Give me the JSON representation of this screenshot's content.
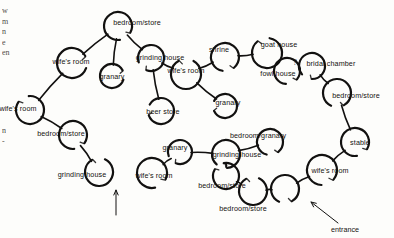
{
  "figure": {
    "kind": "homestead-plan-diagram",
    "ink_color": "#121110",
    "paper_color": "#fdfdfb",
    "width": 394,
    "height": 238
  },
  "margin_text": {
    "upper_left": "w\nm\nn\ne\nen",
    "lower_left": "n\n-"
  },
  "huts": [
    {
      "id": "h1",
      "label": "bedroom/store",
      "cx": 118,
      "cy": 26,
      "r": 14,
      "gap_start": 118,
      "gap_end": 172,
      "label_x": 137,
      "label_y": 23
    },
    {
      "id": "h2",
      "label": "wife's room",
      "cx": 72,
      "cy": 63,
      "r": 15,
      "gap_start": 62,
      "gap_end": 110,
      "label_x": 71,
      "label_y": 62
    },
    {
      "id": "h3",
      "label": "granary",
      "cx": 112,
      "cy": 76,
      "r": 12,
      "gap_start": 62,
      "gap_end": 108,
      "label_x": 112,
      "label_y": 77
    },
    {
      "id": "h4",
      "label": "grinding house",
      "cx": 151,
      "cy": 58,
      "r": 13,
      "gap_start": 200,
      "gap_end": 250,
      "label_x": 160,
      "label_y": 58
    },
    {
      "id": "h5",
      "label": "wife's room",
      "cx": 186,
      "cy": 74,
      "r": 15,
      "gap_start": 330,
      "gap_end": 30,
      "label_x": 186,
      "label_y": 71
    },
    {
      "id": "h6",
      "label": "beer store",
      "cx": 161,
      "cy": 111,
      "r": 13,
      "gap_start": 250,
      "gap_end": 300,
      "label_x": 163,
      "label_y": 112
    },
    {
      "id": "h7",
      "label": "granary",
      "cx": 225,
      "cy": 106,
      "r": 12,
      "gap_start": 245,
      "gap_end": 295,
      "label_x": 228,
      "label_y": 103
    },
    {
      "id": "h8",
      "label": "shrine",
      "cx": 225,
      "cy": 57,
      "r": 14,
      "gap_start": 140,
      "gap_end": 190,
      "label_x": 219,
      "label_y": 50
    },
    {
      "id": "h9",
      "label": "goat house",
      "cx": 267,
      "cy": 53,
      "r": 15,
      "gap_start": 320,
      "gap_end": 10,
      "label_x": 279,
      "label_y": 45
    },
    {
      "id": "h10",
      "label": "fowl house",
      "cx": 287,
      "cy": 71,
      "r": 13,
      "gap_start": 130,
      "gap_end": 185,
      "label_x": 278,
      "label_y": 74
    },
    {
      "id": "h11",
      "label": "bridal chamber",
      "cx": 312,
      "cy": 66,
      "r": 13,
      "gap_start": 180,
      "gap_end": 230,
      "label_x": 331,
      "label_y": 64
    },
    {
      "id": "h12",
      "label": "bedroom/store",
      "cx": 337,
      "cy": 93,
      "r": 14,
      "gap_start": 150,
      "gap_end": 205,
      "label_x": 356,
      "label_y": 96
    },
    {
      "id": "h13",
      "label": "stable",
      "cx": 355,
      "cy": 142,
      "r": 14,
      "gap_start": 120,
      "gap_end": 172,
      "label_x": 360,
      "label_y": 143
    },
    {
      "id": "h14",
      "label": "wife's room",
      "cx": 322,
      "cy": 170,
      "r": 15,
      "gap_start": 130,
      "gap_end": 182,
      "label_x": 330,
      "label_y": 171
    },
    {
      "id": "h15",
      "label": "bedroom/store",
      "cx": 253,
      "cy": 191,
      "r": 14,
      "gap_start": 330,
      "gap_end": 25,
      "label_x": 243,
      "label_y": 209
    },
    {
      "id": "h16",
      "label": "",
      "cx": 285,
      "cy": 189,
      "r": 14,
      "gap_start": 150,
      "gap_end": 205,
      "label_x": 285,
      "label_y": 189
    },
    {
      "id": "h17",
      "label": "bedroom/store",
      "cx": 226,
      "cy": 176,
      "r": 13,
      "gap_start": 300,
      "gap_end": 350,
      "label_x": 222,
      "label_y": 186
    },
    {
      "id": "h18",
      "label": "bedroom/granary",
      "cx": 270,
      "cy": 142,
      "r": 13,
      "gap_start": 140,
      "gap_end": 195,
      "label_x": 258,
      "label_y": 136
    },
    {
      "id": "h19",
      "label": "grinding house",
      "cx": 226,
      "cy": 154,
      "r": 14,
      "gap_start": 175,
      "gap_end": 222,
      "label_x": 237,
      "label_y": 155
    },
    {
      "id": "h20",
      "label": "granary",
      "cx": 180,
      "cy": 152,
      "r": 12,
      "gap_start": 200,
      "gap_end": 250,
      "label_x": 175,
      "label_y": 148
    },
    {
      "id": "h21",
      "label": "wife's room",
      "cx": 152,
      "cy": 173,
      "r": 15,
      "gap_start": 115,
      "gap_end": 168,
      "label_x": 154,
      "label_y": 176
    },
    {
      "id": "h22",
      "label": "grinding house",
      "cx": 99,
      "cy": 172,
      "r": 14,
      "gap_start": 330,
      "gap_end": 25,
      "label_x": 82,
      "label_y": 175
    },
    {
      "id": "h23",
      "label": "bedroom/store",
      "cx": 73,
      "cy": 135,
      "r": 14,
      "gap_start": 125,
      "gap_end": 175,
      "label_x": 61,
      "label_y": 134
    },
    {
      "id": "h24",
      "label": "wife's room",
      "cx": 30,
      "cy": 110,
      "r": 14,
      "gap_start": 305,
      "gap_end": 355,
      "label_x": 18,
      "label_y": 109
    }
  ],
  "links": [
    {
      "from": "h1",
      "to": "h2"
    },
    {
      "from": "h1",
      "to": "h3"
    },
    {
      "from": "h1",
      "to": "h4"
    },
    {
      "from": "h2",
      "to": "h24"
    },
    {
      "from": "h4",
      "to": "h6"
    },
    {
      "from": "h4",
      "to": "h5"
    },
    {
      "from": "h5",
      "to": "h7"
    },
    {
      "from": "h5",
      "to": "h8"
    },
    {
      "from": "h8",
      "to": "h9"
    },
    {
      "from": "h9",
      "to": "h10"
    },
    {
      "from": "h10",
      "to": "h11"
    },
    {
      "from": "h11",
      "to": "h12"
    },
    {
      "from": "h12",
      "to": "h13"
    },
    {
      "from": "h13",
      "to": "h14"
    },
    {
      "from": "h14",
      "to": "h16"
    },
    {
      "from": "h16",
      "to": "h15"
    },
    {
      "from": "h15",
      "to": "h17"
    },
    {
      "from": "h17",
      "to": "h19"
    },
    {
      "from": "h19",
      "to": "h18"
    },
    {
      "from": "h19",
      "to": "h20"
    },
    {
      "from": "h20",
      "to": "h21"
    },
    {
      "from": "h22",
      "to": "h23"
    },
    {
      "from": "h23",
      "to": "h24"
    }
  ],
  "annotations": [
    {
      "id": "entrance",
      "label": "entrance",
      "label_x": 345,
      "label_y": 229,
      "arrow_from_x": 338,
      "arrow_from_y": 223,
      "arrow_to_x": 311,
      "arrow_to_y": 202
    },
    {
      "id": "second-entrance",
      "label": "",
      "label_x": 118,
      "label_y": 224,
      "arrow_from_x": 116,
      "arrow_from_y": 215,
      "arrow_to_x": 116,
      "arrow_to_y": 190
    }
  ],
  "uncertainty_mark": {
    "symbol": "?",
    "x": 295,
    "y": 62
  }
}
